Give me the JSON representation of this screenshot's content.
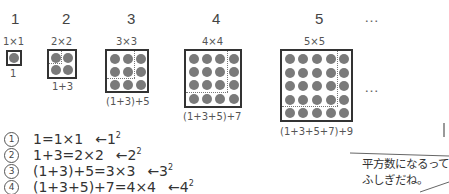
{
  "stages": [
    {
      "index": "1",
      "dim_label": "1×1",
      "n": 1,
      "sum_label": "1"
    },
    {
      "index": "2",
      "dim_label": "2×2",
      "n": 2,
      "sum_label": "1+3"
    },
    {
      "index": "3",
      "dim_label": "3×3",
      "n": 3,
      "sum_label": "(1+3)+5"
    },
    {
      "index": "4",
      "dim_label": "4×4",
      "n": 4,
      "sum_label": "(1+3+5)+7"
    },
    {
      "index": "5",
      "dim_label": "5×5",
      "n": 5,
      "sum_label": "(1+3+5+7)+9"
    }
  ],
  "ellipsis_top": "…",
  "ellipsis_mid": "…",
  "equations": [
    {
      "marker": "1",
      "lhs": "1=1×1",
      "arrow": "←1",
      "power": "2"
    },
    {
      "marker": "2",
      "lhs": "1+3=2×2",
      "arrow": "←2",
      "power": "2"
    },
    {
      "marker": "3",
      "lhs": "(1+3)+5=3×3",
      "arrow": "←3",
      "power": "2"
    },
    {
      "marker": "4",
      "lhs": "(1+3+5)+7=4×4",
      "arrow": "←4",
      "power": "2"
    }
  ],
  "speech_bubble": {
    "line1": "平方数になるって",
    "line2": "ふしぎだね。"
  },
  "colors": {
    "dot": "#7a7a7a",
    "box_border": "#333333",
    "text": "#333333"
  }
}
